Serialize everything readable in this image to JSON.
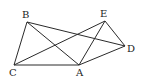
{
  "diagram": {
    "type": "geometry-figure",
    "line_color": "#2a2a2a",
    "vertices": [
      {
        "id": "A",
        "label": "A",
        "x": 79,
        "y": 65,
        "lx": 76,
        "ly": 76
      },
      {
        "id": "B",
        "label": "B",
        "x": 27,
        "y": 22,
        "lx": 22,
        "ly": 18
      },
      {
        "id": "C",
        "label": "C",
        "x": 14,
        "y": 65,
        "lx": 9,
        "ly": 76
      },
      {
        "id": "D",
        "label": "D",
        "x": 125,
        "y": 46,
        "lx": 127,
        "ly": 52
      },
      {
        "id": "E",
        "label": "E",
        "x": 105,
        "y": 21,
        "lx": 100,
        "ly": 17
      }
    ],
    "edges": [
      [
        "B",
        "C"
      ],
      [
        "C",
        "A"
      ],
      [
        "A",
        "D"
      ],
      [
        "D",
        "E"
      ],
      [
        "B",
        "A"
      ],
      [
        "B",
        "D"
      ],
      [
        "C",
        "E"
      ],
      [
        "E",
        "A"
      ]
    ]
  }
}
